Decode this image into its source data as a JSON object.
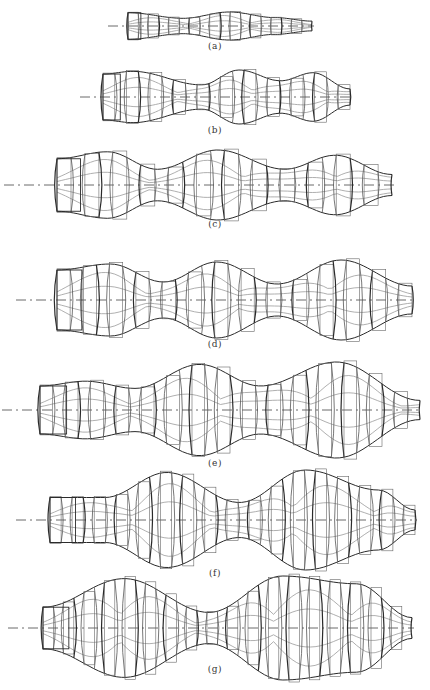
{
  "figure": {
    "panels": [
      {
        "id": "a",
        "caption": "(a)",
        "x0": 128,
        "x1": 312,
        "axis_y": 26,
        "half_h": 14,
        "caption_y": 41,
        "axis_start": 108,
        "bulges": [
          [
            0.0,
            0.95,
            0.05
          ],
          [
            0.3,
            0.55,
            0.45
          ],
          [
            0.55,
            1.0,
            0.55
          ],
          [
            0.8,
            0.6,
            0.8
          ],
          [
            1.0,
            0.35,
            1.0
          ]
        ]
      },
      {
        "id": "b",
        "caption": "(b)",
        "x0": 103,
        "x1": 350,
        "axis_y": 97,
        "half_h": 27,
        "caption_y": 125,
        "axis_start": 80,
        "bulges": [
          [
            0.0,
            0.85,
            0.0
          ],
          [
            0.12,
            0.95,
            0.12
          ],
          [
            0.4,
            0.45,
            0.4
          ],
          [
            0.55,
            1.0,
            0.55
          ],
          [
            0.72,
            0.6,
            0.72
          ],
          [
            0.85,
            0.9,
            0.85
          ],
          [
            1.0,
            0.3,
            1.0
          ]
        ]
      },
      {
        "id": "c",
        "caption": "(c)",
        "x0": 57,
        "x1": 392,
        "axis_y": 185,
        "half_h": 35,
        "caption_y": 219,
        "axis_start": 4,
        "bulges": [
          [
            0.0,
            0.75,
            0.0
          ],
          [
            0.15,
            0.95,
            0.15
          ],
          [
            0.3,
            0.45,
            0.3
          ],
          [
            0.48,
            1.0,
            0.48
          ],
          [
            0.68,
            0.45,
            0.68
          ],
          [
            0.83,
            0.85,
            0.83
          ],
          [
            1.0,
            0.3,
            1.0
          ]
        ]
      },
      {
        "id": "d",
        "caption": "(d)",
        "x0": 57,
        "x1": 412,
        "axis_y": 300,
        "half_h": 40,
        "caption_y": 339,
        "axis_start": 16,
        "bulges": [
          [
            0.0,
            0.75,
            0.0
          ],
          [
            0.15,
            0.9,
            0.15
          ],
          [
            0.3,
            0.45,
            0.3
          ],
          [
            0.45,
            0.95,
            0.45
          ],
          [
            0.62,
            0.4,
            0.62
          ],
          [
            0.8,
            1.0,
            0.8
          ],
          [
            1.0,
            0.35,
            1.0
          ]
        ]
      },
      {
        "id": "e",
        "caption": "(e)",
        "x0": 40,
        "x1": 420,
        "axis_y": 410,
        "half_h": 48,
        "caption_y": 458,
        "axis_start": 2,
        "bulges": [
          [
            0.0,
            0.5,
            0.0
          ],
          [
            0.12,
            0.6,
            0.12
          ],
          [
            0.25,
            0.45,
            0.25
          ],
          [
            0.42,
            0.95,
            0.42
          ],
          [
            0.58,
            0.5,
            0.58
          ],
          [
            0.78,
            1.0,
            0.78
          ],
          [
            1.0,
            0.2,
            1.0
          ]
        ]
      },
      {
        "id": "f",
        "caption": "(f)",
        "x0": 50,
        "x1": 415,
        "axis_y": 520,
        "half_h": 50,
        "caption_y": 568,
        "axis_start": 16,
        "bulges": [
          [
            0.0,
            0.45,
            0.0
          ],
          [
            0.15,
            0.45,
            0.15
          ],
          [
            0.32,
            0.95,
            0.32
          ],
          [
            0.52,
            0.35,
            0.52
          ],
          [
            0.7,
            1.0,
            0.7
          ],
          [
            0.9,
            0.6,
            0.9
          ],
          [
            1.0,
            0.2,
            1.0
          ]
        ]
      },
      {
        "id": "g",
        "caption": "(g)",
        "x0": 43,
        "x1": 412,
        "axis_y": 628,
        "half_h": 52,
        "caption_y": 664,
        "axis_start": 8,
        "bulges": [
          [
            0.0,
            0.4,
            0.0
          ],
          [
            0.22,
            0.95,
            0.22
          ],
          [
            0.45,
            0.3,
            0.45
          ],
          [
            0.65,
            1.0,
            0.65
          ],
          [
            0.85,
            0.85,
            0.85
          ],
          [
            1.0,
            0.2,
            1.0
          ]
        ]
      }
    ],
    "line_colors": {
      "dark": "#2a2a2a",
      "light": "#9a9a9a",
      "axis": "#444444"
    }
  }
}
